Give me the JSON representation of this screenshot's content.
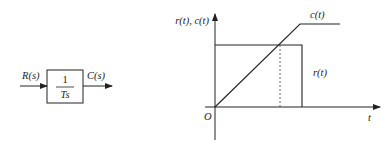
{
  "block_diagram": {
    "input_label": "R(s)",
    "output_label": "C(s)",
    "transfer_numerator": "1",
    "transfer_denominator": "Ts"
  },
  "plot": {
    "y_axis_label": "r(t), c(t)",
    "x_axis_label": "t",
    "origin_label": "O",
    "curves": [
      {
        "name": "c(t)",
        "description": "ramp rising from origin, then constant"
      },
      {
        "name": "r(t)",
        "description": "rectangular pulse"
      }
    ],
    "c_label": "c(t)",
    "r_label": "r(t)"
  },
  "colors": {
    "stroke": "#222222",
    "background": "#ffffff"
  }
}
